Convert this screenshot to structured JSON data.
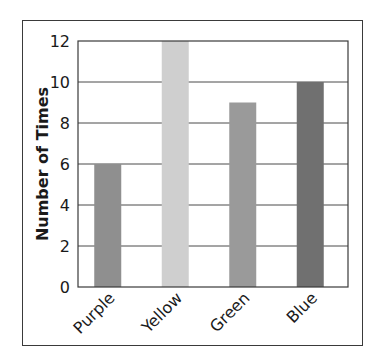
{
  "chart_data": {
    "type": "bar",
    "title": "",
    "xlabel": "",
    "ylabel": "Number of Times",
    "categories": [
      "Purple",
      "Yellow",
      "Green",
      "Blue"
    ],
    "values": [
      6,
      12,
      9,
      10
    ],
    "bar_colors": [
      "#8f8f8f",
      "#cfcfcf",
      "#9a9a9a",
      "#707070"
    ],
    "ylim": [
      0,
      12
    ],
    "yticks": [
      0,
      2,
      4,
      6,
      8,
      10,
      12
    ],
    "grid": true,
    "legend": null
  }
}
